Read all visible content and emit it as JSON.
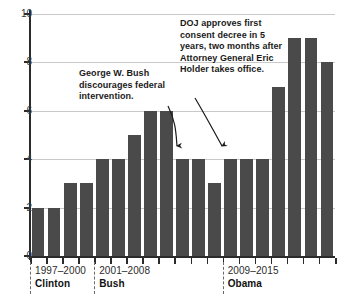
{
  "chart_data": {
    "type": "bar",
    "title": "",
    "subtitle": "",
    "xlabel": "",
    "ylabel": "",
    "ylim": [
      0,
      10
    ],
    "ytick_labels": [
      "10",
      "8",
      "6",
      "4",
      "2",
      "0"
    ],
    "ytick_values": [
      10,
      8,
      6,
      4,
      2,
      0
    ],
    "grid": true,
    "legend": "none",
    "bar_color": "#4a4a4a",
    "categories": [
      "1",
      "2",
      "3",
      "4",
      "5",
      "6",
      "7",
      "8",
      "9",
      "10",
      "11",
      "12",
      "13",
      "14",
      "15",
      "16",
      "17",
      "18",
      "19"
    ],
    "values": [
      2,
      2,
      3,
      3,
      4,
      4,
      5,
      6,
      6,
      4,
      4,
      3,
      4,
      4,
      4,
      7,
      9,
      9,
      8
    ],
    "eras": [
      {
        "years": "1997–2000",
        "name": "Clinton",
        "start_index": 0,
        "end_index": 3
      },
      {
        "years": "2001–2008",
        "name": "Bush",
        "start_index": 4,
        "end_index": 11
      },
      {
        "years": "2009–2015",
        "name": "Obama",
        "start_index": 12,
        "end_index": 18
      }
    ],
    "annotations": [
      {
        "id": "bush",
        "text": "George W. Bush discourages federal intervention.",
        "points_to_index": 9,
        "points_to_value": 4
      },
      {
        "id": "doj",
        "text": "DOJ approves first consent decree in 5 years, two months after Attorney General Eric Holder takes office.",
        "points_to_index": 12,
        "points_to_value": 4
      }
    ]
  }
}
